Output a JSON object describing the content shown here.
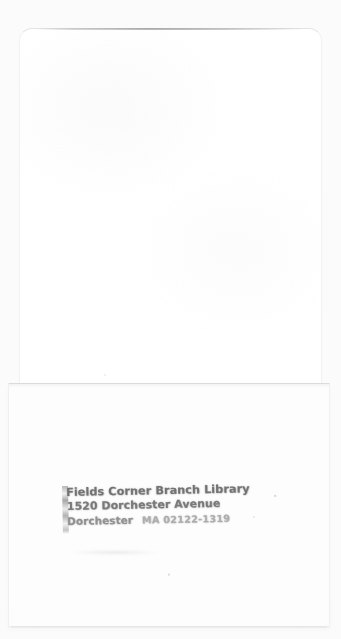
{
  "document": {
    "kind": "scanned-book-pocket",
    "background_color": "#fbfbfb",
    "leaf_color": "#ffffff",
    "pocket_color": "#fdfdfd",
    "ink_color": "#6f6f6f"
  },
  "stamp": {
    "line1": "Fields Corner Branch Library",
    "line2": "1520 Dorchester Avenue",
    "line3_city": "Dorchester",
    "line3_state_zip": "MA 02122-1319"
  }
}
